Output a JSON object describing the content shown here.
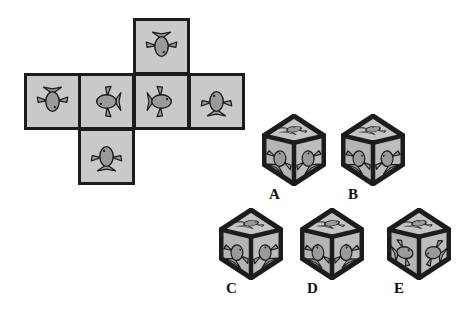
{
  "puzzle": {
    "type": "cube-net-spatial-reasoning",
    "title": "",
    "background_color": "#ffffff",
    "tile_fill": "#c9c9c9",
    "tile_border": "#1c1c1c",
    "fish_body_color": "#9a9a9a",
    "fish_outline_color": "#1c1c1c",
    "cube_face_top": "#c4c4c4",
    "cube_face_left": "#b4b4b4",
    "cube_face_right": "#bdbdbd",
    "cube_edge_color": "#1c1c1c"
  },
  "net": {
    "name": "unfolded-cube-net",
    "shape": "cross",
    "tiles": [
      {
        "id": "net-tile-top",
        "position": "top",
        "x": 133,
        "y": 18,
        "size": 57,
        "fish_direction": "down",
        "fish_label": "fish pointing down"
      },
      {
        "id": "net-tile-row-1",
        "position": "row-col-1",
        "x": 24,
        "y": 73,
        "size": 57,
        "fish_direction": "down",
        "fish_label": "fish pointing down"
      },
      {
        "id": "net-tile-row-2",
        "position": "row-col-2",
        "x": 78,
        "y": 73,
        "size": 57,
        "fish_direction": "left",
        "fish_label": "fish facing left"
      },
      {
        "id": "net-tile-row-3",
        "position": "row-col-3",
        "x": 133,
        "y": 73,
        "size": 57,
        "fish_direction": "right",
        "fish_label": "fish facing right"
      },
      {
        "id": "net-tile-row-4",
        "position": "row-col-4",
        "x": 188,
        "y": 73,
        "size": 57,
        "fish_direction": "up",
        "fish_label": "fish pointing up"
      },
      {
        "id": "net-tile-bottom",
        "position": "below-col-2",
        "x": 78,
        "y": 128,
        "size": 57,
        "fish_direction": "up",
        "fish_label": "fish pointing up"
      }
    ]
  },
  "options": [
    {
      "id": "option-a",
      "label": "A",
      "x": 262,
      "y": 114,
      "w": 64,
      "h": 72,
      "label_x": 269,
      "label_y": 186,
      "faces": {
        "top": {
          "fish_rotation": -20,
          "fish_flip": false
        },
        "left": {
          "fish_rotation": 20,
          "fish_flip": false
        },
        "right": {
          "fish_rotation": -20,
          "fish_flip": true
        }
      }
    },
    {
      "id": "option-b",
      "label": "B",
      "x": 341,
      "y": 114,
      "w": 64,
      "h": 72,
      "label_x": 348,
      "label_y": 186,
      "faces": {
        "top": {
          "fish_rotation": -20,
          "fish_flip": false
        },
        "left": {
          "fish_rotation": 18,
          "fish_flip": true
        },
        "right": {
          "fish_rotation": -18,
          "fish_flip": false
        }
      }
    },
    {
      "id": "option-c",
      "label": "C",
      "x": 219,
      "y": 208,
      "w": 64,
      "h": 72,
      "label_x": 226,
      "label_y": 280,
      "faces": {
        "top": {
          "fish_rotation": -20,
          "fish_flip": true
        },
        "left": {
          "fish_rotation": 18,
          "fish_flip": true
        },
        "right": {
          "fish_rotation": -20,
          "fish_flip": true
        }
      }
    },
    {
      "id": "option-d",
      "label": "D",
      "x": 300,
      "y": 208,
      "w": 64,
      "h": 72,
      "label_x": 307,
      "label_y": 280,
      "faces": {
        "top": {
          "fish_rotation": -18,
          "fish_flip": true
        },
        "left": {
          "fish_rotation": 16,
          "fish_flip": false
        },
        "right": {
          "fish_rotation": -16,
          "fish_flip": true
        }
      }
    },
    {
      "id": "option-e",
      "label": "E",
      "x": 387,
      "y": 208,
      "w": 64,
      "h": 72,
      "label_x": 394,
      "label_y": 280,
      "faces": {
        "top": {
          "fish_rotation": -22,
          "fish_flip": false
        },
        "left": {
          "fish_rotation": 70,
          "fish_flip": false
        },
        "right": {
          "fish_rotation": -60,
          "fish_flip": false
        }
      }
    }
  ]
}
